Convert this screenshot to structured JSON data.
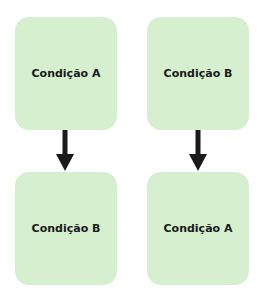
{
  "diagram": {
    "left_column": {
      "top_box": {
        "label": "Condição A"
      },
      "bottom_box": {
        "label": "Condição B"
      }
    },
    "right_column": {
      "top_box": {
        "label": "Condição B"
      },
      "bottom_box": {
        "label": "Condição A"
      }
    },
    "colors": {
      "box_fill": "#d6f0cf",
      "arrow": "#1a1a1a",
      "text": "#1a1a1a"
    }
  }
}
